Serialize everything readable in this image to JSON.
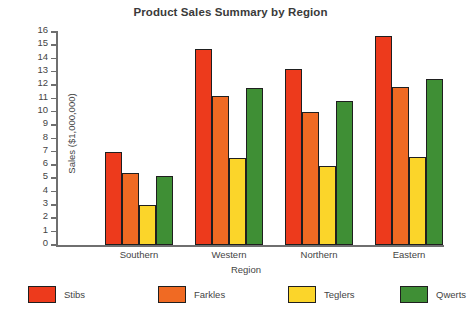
{
  "chart_data": {
    "type": "bar",
    "title": "Product Sales Summary by Region",
    "xlabel": "Region",
    "ylabel": "Sales ($1,000,000)",
    "categories": [
      "Southern",
      "Western",
      "Northern",
      "Eastern"
    ],
    "series": [
      {
        "name": "Stibs",
        "color": "#ed3a1c",
        "values": [
          7.0,
          14.7,
          13.2,
          15.7
        ]
      },
      {
        "name": "Farkles",
        "color": "#f06a23",
        "values": [
          5.4,
          11.2,
          10.0,
          11.9
        ]
      },
      {
        "name": "Teglers",
        "color": "#fbd52a",
        "values": [
          3.0,
          6.5,
          5.9,
          6.6
        ]
      },
      {
        "name": "Qwerts",
        "color": "#3f8f35",
        "values": [
          5.2,
          11.8,
          10.8,
          12.5
        ]
      }
    ],
    "ylim": [
      0,
      16
    ],
    "yticks": [
      0,
      1,
      2,
      3,
      4,
      5,
      6,
      7,
      8,
      9,
      10,
      11,
      12,
      13,
      14,
      15,
      16
    ],
    "grid": false,
    "legend_position": "bottom"
  }
}
